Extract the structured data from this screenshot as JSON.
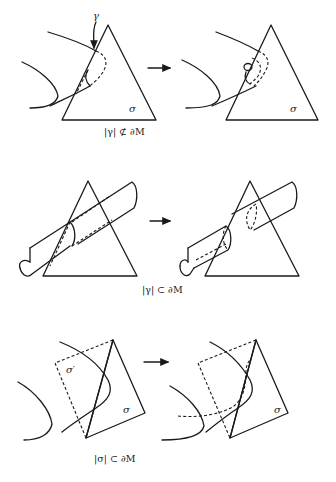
{
  "figure": {
    "panels": [
      {
        "id": "gamma-not-in-boundary",
        "caption": "|γ| ⊄ ∂M",
        "labels": {
          "curve": "γ",
          "simplex": "σ"
        },
        "arrow": "→"
      },
      {
        "id": "gamma-in-boundary",
        "caption": "|γ| ⊂ ∂M",
        "arrow": "→"
      },
      {
        "id": "sigma-in-boundary",
        "caption": "|σ| ⊂ ∂M",
        "labels": {
          "simplex": "σ",
          "simplex_prime": "σ′"
        },
        "arrow": "→"
      }
    ]
  }
}
